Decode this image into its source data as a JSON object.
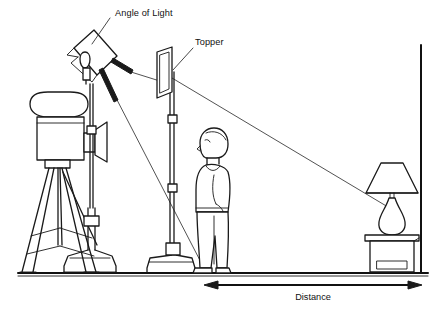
{
  "diagram": {
    "background_color": "#ffffff",
    "ink_color": "#1a1a1a",
    "labels": {
      "angle_of_light": "Angle of Light",
      "topper": "Topper",
      "distance": "Distance"
    },
    "objects": [
      {
        "name": "film-camera-on-tripod",
        "label": "Film camera on tripod"
      },
      {
        "name": "light-stand-with-softbox",
        "label": "Light head on stand"
      },
      {
        "name": "topper-flag",
        "label": "Topper flag panel"
      },
      {
        "name": "standing-person",
        "label": "Person standing"
      },
      {
        "name": "table-lamp",
        "label": "Table lamp on side table"
      },
      {
        "name": "floor-line",
        "label": "Floor"
      },
      {
        "name": "wall-line",
        "label": "Back wall"
      }
    ],
    "annotations": {
      "light_rays_count": 3,
      "dimension_arrow": "double-headed",
      "dimension_from": "light stand base",
      "dimension_to": "back wall"
    }
  }
}
